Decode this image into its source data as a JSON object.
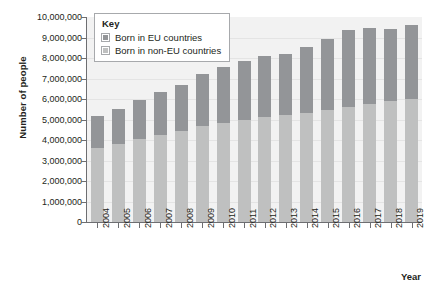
{
  "chart_data": {
    "type": "bar",
    "subtype": "stacked-bar",
    "title": "",
    "xlabel": "Year",
    "ylabel": "Number of people",
    "categories": [
      "2004",
      "2005",
      "2006",
      "2007",
      "2008",
      "2009",
      "2010",
      "2011",
      "2012",
      "2013",
      "2014",
      "2015",
      "2016",
      "2017",
      "2018",
      "2019"
    ],
    "series": [
      {
        "name": "Born in non-EU countries",
        "color": "#bfc0c0",
        "values": [
          3600000,
          3800000,
          4050000,
          4250000,
          4450000,
          4700000,
          4850000,
          5000000,
          5100000,
          5200000,
          5300000,
          5450000,
          5600000,
          5750000,
          5900000,
          6000000
        ]
      },
      {
        "name": "Born in EU countries",
        "color": "#939598",
        "values": [
          1550000,
          1700000,
          1900000,
          2100000,
          2250000,
          2500000,
          2700000,
          2850000,
          3000000,
          3000000,
          3250000,
          3500000,
          3750000,
          3700000,
          3500000,
          3600000
        ]
      }
    ],
    "totals": [
      5150000,
      5500000,
      5950000,
      6350000,
      6700000,
      7200000,
      7550000,
      7850000,
      8100000,
      8200000,
      8550000,
      8950000,
      9350000,
      9450000,
      9400000,
      9600000
    ],
    "ylim": [
      0,
      10000000
    ],
    "y_ticks": [
      {
        "value": 0,
        "label": "0"
      },
      {
        "value": 1000000,
        "label": "1,000,000"
      },
      {
        "value": 2000000,
        "label": "2,000,000"
      },
      {
        "value": 3000000,
        "label": "3,000,000"
      },
      {
        "value": 4000000,
        "label": "4,000,000"
      },
      {
        "value": 5000000,
        "label": "5,000,000"
      },
      {
        "value": 6000000,
        "label": "6,000,000"
      },
      {
        "value": 7000000,
        "label": "7,000,000"
      },
      {
        "value": 8000000,
        "label": "8,000,000"
      },
      {
        "value": 9000000,
        "label": "9,000,000"
      },
      {
        "value": 10000000,
        "label": "10,000,000"
      }
    ],
    "grid": true,
    "legend_position": "top-left"
  },
  "legend": {
    "title": "Key",
    "entries": [
      {
        "label": "Born in EU countries",
        "color": "#939598"
      },
      {
        "label": "Born in non-EU countries",
        "color": "#bfc0c0"
      }
    ]
  },
  "axes": {
    "y_title": "Number of people",
    "x_title": "Year"
  },
  "colors": {
    "eu": "#939598",
    "non_eu": "#bfc0c0",
    "plot_background": "#f2f2f2",
    "axis": "#6d6e71",
    "text": "#231f20"
  }
}
